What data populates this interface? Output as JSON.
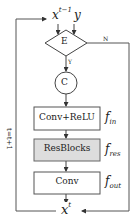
{
  "diagram": {
    "type": "flowchart",
    "colors": {
      "line": "#444444",
      "box_fill": "#ffffff",
      "resblock_fill": "#dddddd",
      "text": "#222222"
    },
    "input": {
      "x_label": "x",
      "x_sup": "t−1",
      "y_label": "y"
    },
    "decision": {
      "label": "E",
      "yes_label": "Y",
      "no_label": "N"
    },
    "concat": {
      "label": "C"
    },
    "blocks": [
      {
        "label": "Conv+ReLU",
        "func": "f",
        "func_sub": "in"
      },
      {
        "label": "ResBlocks",
        "func": "f",
        "func_sub": "res"
      },
      {
        "label": "Conv",
        "func": "f",
        "func_sub": "out"
      }
    ],
    "output": {
      "x_label": "x",
      "x_sup": "t"
    },
    "loop_label": "t=t+1"
  }
}
